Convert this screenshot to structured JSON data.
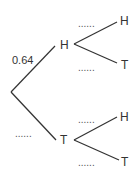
{
  "diagram": {
    "type": "probability-tree",
    "first_stage": {
      "branches": [
        {
          "outcome": "H",
          "probability": "0.64"
        },
        {
          "outcome": "T",
          "probability": "......"
        }
      ]
    },
    "second_stage": {
      "after_H": [
        {
          "outcome": "H",
          "probability": "......"
        },
        {
          "outcome": "T",
          "probability": "......"
        }
      ],
      "after_T": [
        {
          "outcome": "H",
          "probability": "......"
        },
        {
          "outcome": "T",
          "probability": "......"
        }
      ]
    }
  },
  "line_color": "#333333"
}
